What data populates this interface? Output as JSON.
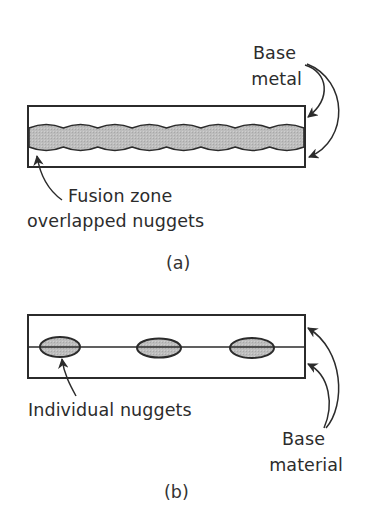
{
  "figure": {
    "colors": {
      "stroke": "#2b2b2b",
      "nugget_fill": "#b9b9b9",
      "background": "#ffffff"
    },
    "panel_a": {
      "caption": "(a)",
      "base_metal_label_line1": "Base",
      "base_metal_label_line2": "metal",
      "fusion_zone_label_line1": "Fusion zone",
      "fusion_zone_label_line2": "overlapped nuggets",
      "plate": {
        "x": 28,
        "y": 106,
        "width": 277,
        "height": 61
      },
      "fusion_band": {
        "top": 125,
        "bottom": 150,
        "overlapping_nugget_count": 8
      }
    },
    "panel_b": {
      "caption": "(b)",
      "individual_nuggets_label": "Individual nuggets",
      "base_material_label_line1": "Base",
      "base_material_label_line2": "material",
      "plate": {
        "x": 28,
        "y": 315,
        "width": 277,
        "height": 63,
        "interface_y": 347
      },
      "nuggets": [
        {
          "cx": 60,
          "cy": 347,
          "rx": 20,
          "ry": 10
        },
        {
          "cx": 159,
          "cy": 348,
          "rx": 22,
          "ry": 9.5
        },
        {
          "cx": 252,
          "cy": 348,
          "rx": 22,
          "ry": 10
        }
      ]
    }
  }
}
